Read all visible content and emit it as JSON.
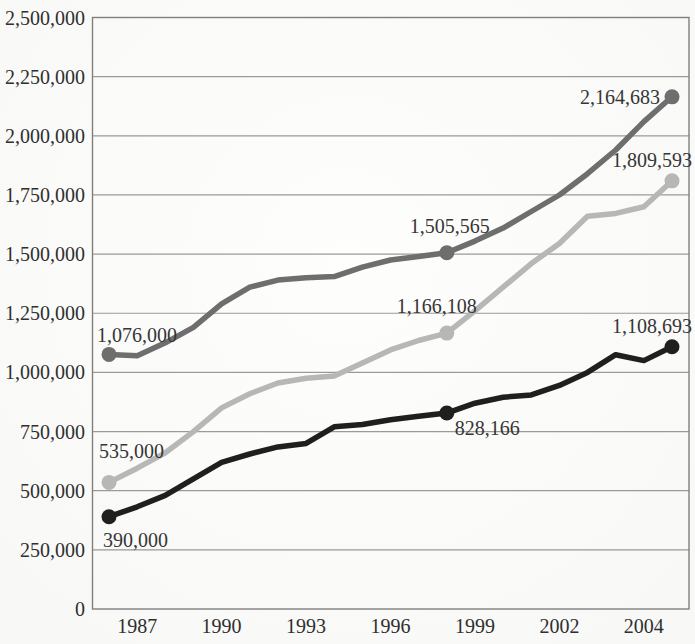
{
  "chart_data": {
    "type": "line",
    "title": "",
    "xlabel": "",
    "ylabel": "",
    "grid": "horizontal",
    "legend": "none",
    "colors": {
      "dark_gray": "#6e6e6e",
      "light_gray": "#b7b7b7",
      "black": "#1f1f1f",
      "gridline": "#9a9a9a",
      "border": "#7f7f7f",
      "label_text": "#333333"
    },
    "x_axis": {
      "n_points": 21,
      "ticks": [
        {
          "pos": 1,
          "label": "1987"
        },
        {
          "pos": 4,
          "label": "1990"
        },
        {
          "pos": 7,
          "label": "1993"
        },
        {
          "pos": 10,
          "label": "1996"
        },
        {
          "pos": 13,
          "label": "1999"
        },
        {
          "pos": 16,
          "label": "2002"
        },
        {
          "pos": 19,
          "label": "2004"
        }
      ]
    },
    "y_axis": {
      "min": 0,
      "max": 2500000,
      "step": 250000,
      "tick_labels": [
        {
          "value": 2500000,
          "label": "2,500,000"
        },
        {
          "value": 2250000,
          "label": "2,250,000"
        },
        {
          "value": 2000000,
          "label": "2,000,000"
        },
        {
          "value": 1750000,
          "label": "1,750,000"
        },
        {
          "value": 1500000,
          "label": "1,500,000"
        },
        {
          "value": 1250000,
          "label": "1,250,000"
        },
        {
          "value": 1000000,
          "label": "1,000,000"
        },
        {
          "value": 750000,
          "label": "750,000"
        },
        {
          "value": 500000,
          "label": "500,000"
        },
        {
          "value": 250000,
          "label": "250,000"
        },
        {
          "value": 0,
          "label": "0"
        }
      ]
    },
    "series": [
      {
        "name": "dark-gray",
        "color": "#6e6e6e",
        "values": [
          1076000,
          1070000,
          1125000,
          1190000,
          1290000,
          1360000,
          1390000,
          1400000,
          1405000,
          1445000,
          1475000,
          1490000,
          1505565,
          1555000,
          1610000,
          1680000,
          1750000,
          1840000,
          1940000,
          2060000,
          2164683
        ],
        "labeled_points": [
          {
            "pos": 0,
            "label": "1,076,000",
            "value": 1076000,
            "anchor": "start",
            "dx": -12,
            "dy": -12
          },
          {
            "pos": 12,
            "label": "1,505,565",
            "value": 1505565,
            "anchor": "middle",
            "dx": 3,
            "dy": -20
          },
          {
            "pos": 20,
            "label": "2,164,683",
            "value": 2164683,
            "anchor": "end",
            "dx": -12,
            "dy": 7
          }
        ]
      },
      {
        "name": "light-gray",
        "color": "#b7b7b7",
        "values": [
          535000,
          595000,
          660000,
          750000,
          850000,
          910000,
          955000,
          975000,
          985000,
          1040000,
          1095000,
          1135000,
          1166108,
          1260000,
          1360000,
          1460000,
          1545000,
          1660000,
          1672000,
          1700000,
          1809593
        ],
        "labeled_points": [
          {
            "pos": 0,
            "label": "535,000",
            "value": 535000,
            "anchor": "start",
            "dx": -10,
            "dy": -24
          },
          {
            "pos": 12,
            "label": "1,166,108",
            "value": 1166108,
            "anchor": "middle",
            "dx": -10,
            "dy": -20
          },
          {
            "pos": 20,
            "label": "1,809,593",
            "value": 1809593,
            "anchor": "end",
            "dx": 20,
            "dy": -14
          }
        ]
      },
      {
        "name": "black",
        "color": "#1f1f1f",
        "values": [
          390000,
          432000,
          480000,
          550000,
          620000,
          655000,
          685000,
          700000,
          770000,
          780000,
          800000,
          815000,
          828166,
          870000,
          895000,
          905000,
          945000,
          1000000,
          1075000,
          1050000,
          1108693
        ],
        "labeled_points": [
          {
            "pos": 0,
            "label": "390,000",
            "value": 390000,
            "anchor": "start",
            "dx": -6,
            "dy": 30
          },
          {
            "pos": 12,
            "label": "828,166",
            "value": 828166,
            "anchor": "start",
            "dx": 8,
            "dy": 22
          },
          {
            "pos": 20,
            "label": "1,108,693",
            "value": 1108693,
            "anchor": "end",
            "dx": 20,
            "dy": -14
          }
        ]
      }
    ]
  }
}
